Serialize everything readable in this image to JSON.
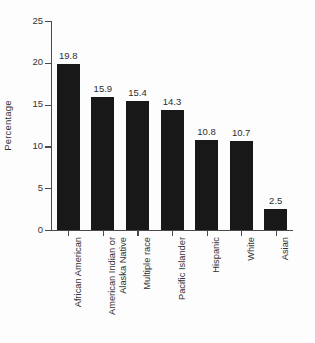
{
  "chart_data": {
    "type": "bar",
    "title": "",
    "subtitle": "",
    "xlabel": "",
    "ylabel": "Percentage",
    "categories": [
      "African American",
      "American Indian or\nAlaska Native",
      "Multiple race",
      "Pacific Islander",
      "Hispanic",
      "White",
      "Asian"
    ],
    "values": [
      19.8,
      15.9,
      15.4,
      14.3,
      10.8,
      10.7,
      2.5
    ],
    "value_labels": [
      "19.8",
      "15.9",
      "15.4",
      "14.3",
      "10.8",
      "10.7",
      "2.5"
    ],
    "ylim": [
      0,
      25
    ],
    "yticks": [
      0,
      5,
      10,
      15,
      20,
      25
    ],
    "ytick_labels": [
      "0",
      "5",
      "10",
      "15",
      "20",
      "25"
    ],
    "grid": false,
    "legend": null,
    "bar_color": "#181818",
    "axis_color": "#4a4a4a",
    "text_color": "#333333",
    "background_color": "#fdfdfd"
  }
}
